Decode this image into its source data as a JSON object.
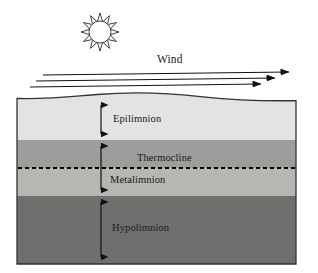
{
  "figure": {
    "kind": "lake-thermal-stratification-diagram",
    "width": 318,
    "height": 273,
    "background": "#ffffff"
  },
  "sun": {
    "icon": "sun-icon",
    "center_x": 100,
    "center_y": 32,
    "core_radius": 11,
    "ray_count": 12,
    "ray_length": 8,
    "fill": "#ffffff",
    "stroke": "#2a2a2a"
  },
  "wind": {
    "label": "Wind",
    "label_x": 157,
    "label_y": 53,
    "arrow_color": "#111111",
    "arrows": [
      {
        "x1": 43,
        "y1": 75,
        "x2": 289,
        "y2": 72
      },
      {
        "x1": 36,
        "y1": 81,
        "x2": 275,
        "y2": 78
      },
      {
        "x1": 30,
        "y1": 87,
        "x2": 261,
        "y2": 84
      }
    ]
  },
  "water_body": {
    "left": 17,
    "right": 296,
    "surface_y": 97,
    "bottom_y": 264,
    "border_color": "#333333",
    "surface_wave": "gentle single crest"
  },
  "layers": [
    {
      "name": "epilimnion",
      "label": "Epilimnion",
      "color": "#e3e3e1",
      "top": 98,
      "bottom": 140
    },
    {
      "name": "metalimnion-upper",
      "label": "",
      "color": "#9d9d9b",
      "top": 140,
      "bottom": 168
    },
    {
      "name": "metalimnion-lower",
      "label": "Metalimnion",
      "color": "#b6b6b3",
      "top": 168,
      "bottom": 196
    },
    {
      "name": "hypolimnion",
      "label": "Hypolimnion",
      "color": "#6f6f6d",
      "top": 196,
      "bottom": 264
    }
  ],
  "thermocline": {
    "label": "Thermocline",
    "y": 168,
    "style": "dashed",
    "color": "#000000",
    "dash": "4 3"
  },
  "depth_arrows": {
    "x": 101,
    "color": "#111111",
    "spans": [
      {
        "name": "epilimnion-depth-arrow",
        "top": 100,
        "bottom": 139
      },
      {
        "name": "metalimnion-depth-arrow",
        "top": 141,
        "bottom": 195
      },
      {
        "name": "hypolimnion-depth-arrow",
        "top": 197,
        "bottom": 262
      }
    ]
  },
  "labels": {
    "wind": "Wind",
    "epilimnion": "Epilimnion",
    "thermocline": "Thermocline",
    "metalimnion": "Metalimnion",
    "hypolimnion": "Hypolimnion"
  }
}
